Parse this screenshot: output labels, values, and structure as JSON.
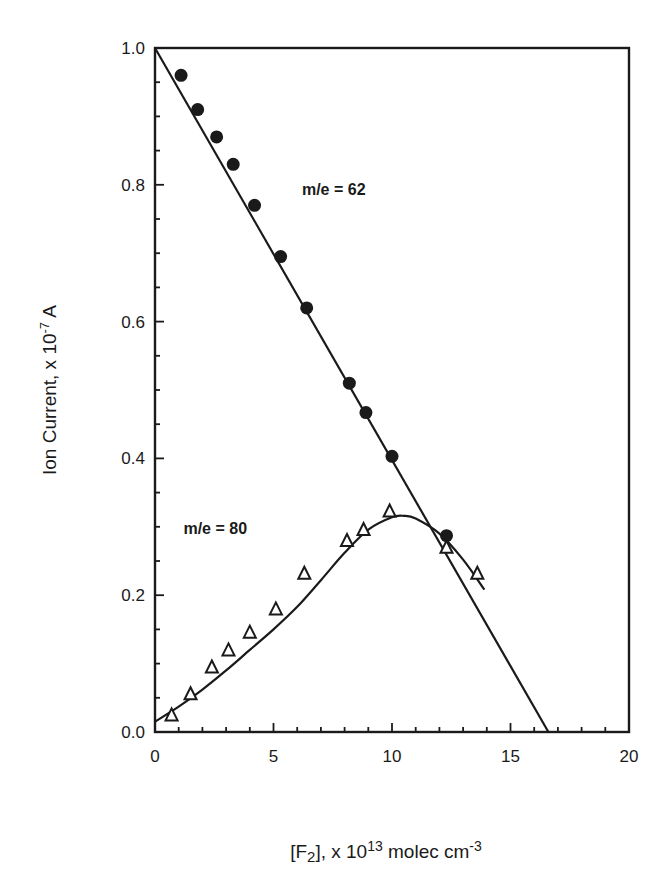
{
  "chart_data": {
    "type": "scatter",
    "title": "",
    "xlabel": "[F2], x 10^13 molec cm-3",
    "ylabel": "Ion Current, x 10-7 A",
    "xlim": [
      0,
      20
    ],
    "ylim": [
      0.0,
      1.0
    ],
    "x_ticks": [
      0,
      5,
      10,
      15,
      20
    ],
    "x_tick_labels": [
      "0",
      "5",
      "10",
      "15",
      "20"
    ],
    "y_ticks": [
      0.0,
      0.2,
      0.4,
      0.6,
      0.8,
      1.0
    ],
    "y_tick_labels": [
      "0.0",
      "0.2",
      "0.4",
      "0.6",
      "0.8",
      "1.0"
    ],
    "x_minor_step": 1,
    "y_minor_step": 0.05,
    "grid": false,
    "legend": "none (inline annotations)",
    "series": [
      {
        "name": "m/e = 62",
        "marker": "filled-circle",
        "x": [
          1.1,
          1.8,
          2.6,
          3.3,
          4.2,
          5.3,
          6.4,
          8.2,
          8.9,
          10.0,
          12.3
        ],
        "y": [
          0.96,
          0.91,
          0.87,
          0.83,
          0.77,
          0.695,
          0.62,
          0.51,
          0.467,
          0.403,
          0.287
        ],
        "fit": {
          "type": "line",
          "x": [
            0,
            16.6
          ],
          "y": [
            1.0,
            0.0
          ]
        }
      },
      {
        "name": "m/e = 80",
        "marker": "open-triangle",
        "x": [
          0.7,
          1.5,
          2.4,
          3.1,
          4.0,
          5.1,
          6.3,
          8.1,
          8.8,
          9.9,
          12.3,
          13.6
        ],
        "y": [
          0.025,
          0.056,
          0.095,
          0.12,
          0.146,
          0.18,
          0.232,
          0.28,
          0.296,
          0.323,
          0.27,
          0.232
        ],
        "fit": {
          "type": "curve",
          "x": [
            0,
            1,
            2,
            3,
            4,
            5,
            6,
            7,
            8,
            9,
            10,
            10.5,
            11,
            12,
            13,
            13.9
          ],
          "y": [
            0.015,
            0.037,
            0.062,
            0.09,
            0.12,
            0.15,
            0.183,
            0.222,
            0.262,
            0.296,
            0.314,
            0.316,
            0.312,
            0.29,
            0.252,
            0.208
          ]
        }
      }
    ],
    "annotations": [
      {
        "text": "m/e = 62",
        "x": 6.2,
        "y": 0.785
      },
      {
        "text": "m/e = 80",
        "x": 1.2,
        "y": 0.29
      }
    ]
  },
  "labels": {
    "ylabel": "Ion Current, x 10-7 A",
    "xlabel_main": "[F",
    "xlabel_sub": "2",
    "xlabel_mid": "], x 10",
    "xlabel_sup": "13",
    "xlabel_tail": " molec cm",
    "xlabel_sup2": "-3",
    "ylabel_main": "Ion Current, x 10",
    "ylabel_sup": "-7",
    "ylabel_tail": " A"
  }
}
